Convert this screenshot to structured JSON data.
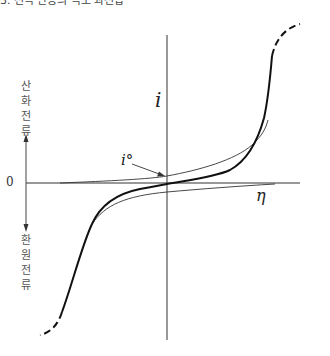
{
  "caption": "3. 전극 반응의 속도 과전압",
  "y_axis": {
    "symbol": "i",
    "positive_label": "산화전류",
    "negative_label": "환원전류"
  },
  "x_axis": {
    "symbol": "η",
    "origin_label": "0"
  },
  "annotation": {
    "symbol": "i°",
    "target": "exchange current at equilibrium (η = 0)"
  },
  "curves": [
    {
      "name": "net-current-curve",
      "style": "thick",
      "description": "Net current vs overpotential; dashed at both limiting-current extremes"
    },
    {
      "name": "anodic-partial-current-curve",
      "style": "thin",
      "description": "Oxidation partial current"
    },
    {
      "name": "cathodic-partial-current-curve",
      "style": "thin",
      "description": "Reduction partial current"
    }
  ]
}
